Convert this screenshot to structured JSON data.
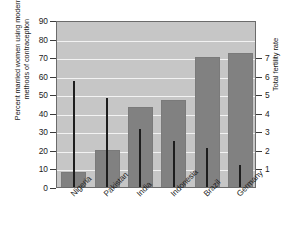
{
  "chart_data": {
    "type": "bar",
    "title": "",
    "subtitle": "",
    "categories": [
      "Nigeria",
      "Pakistan",
      "India",
      "Indonesia",
      "Brazil",
      "Germany"
    ],
    "xlabel": "",
    "ylabel": "Percent married women using modern\nmethods of contraception",
    "ylabel_right": "Total fertility rate",
    "ylim": [
      0,
      90
    ],
    "yticks": [
      0,
      10,
      20,
      30,
      40,
      50,
      60,
      70,
      80,
      90
    ],
    "ylim_right": [
      0,
      9
    ],
    "yticks_right": [
      1,
      2,
      3,
      4,
      5,
      6,
      7
    ],
    "grid": true,
    "legend": "none",
    "series": [
      {
        "name": "Percent married women using modern methods of contraception",
        "axis": "left",
        "render": "bar",
        "color": "#818181",
        "values": [
          8,
          20,
          43,
          47,
          70,
          72
        ]
      },
      {
        "name": "Total fertility rate",
        "axis": "right",
        "render": "stick",
        "color": "#1d1d1d",
        "values": [
          5.7,
          4.8,
          3.1,
          2.5,
          2.1,
          1.2
        ]
      }
    ],
    "plot_background": "#c6c6c6",
    "gridline_color": "#f2f2f2",
    "frame_color": "#6b6b6b"
  }
}
